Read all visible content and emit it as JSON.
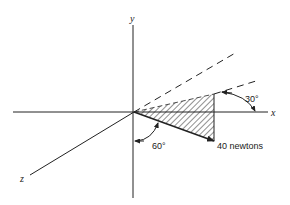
{
  "diagram": {
    "axes": {
      "x_label": "x",
      "y_label": "y",
      "z_label": "z"
    },
    "force": {
      "magnitude_label": "40 newtons",
      "magnitude": 40,
      "unit": "newtons"
    },
    "angles": {
      "angle_from_x_label": "30°",
      "angle_from_y_label": "60°"
    },
    "colors": {
      "line": "#222222",
      "background": "#ffffff"
    }
  }
}
